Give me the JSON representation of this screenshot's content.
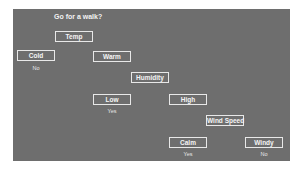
{
  "diagram": {
    "title": "Go for a walk?",
    "colors": {
      "background": "#6e6e6e",
      "node_border": "#e8e8e8",
      "text": "#f4f4f4"
    },
    "nodes": {
      "temp": "Temp",
      "cold": "Cold",
      "warm": "Warm",
      "humidity": "Humidity",
      "low": "Low",
      "high": "High",
      "wind_speed": "Wind Speed",
      "calm": "Calm",
      "windy": "Windy"
    },
    "outcomes": {
      "cold": "No",
      "low": "Yes",
      "calm": "Yes",
      "windy": "No"
    }
  }
}
